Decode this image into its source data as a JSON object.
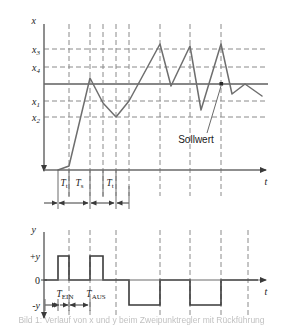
{
  "figure": {
    "caption": "Bild 1: Verlauf von x und y beim Zweipunktregler mit Rückführung"
  },
  "upper_plot": {
    "y_axis_label": "x",
    "x_axis_label": "t",
    "y_tick_labels": [
      "x3",
      "x4",
      "x1",
      "x2"
    ],
    "setpoint_annotation": "Sollwert",
    "interval_labels": [
      "Tt",
      "Ts",
      "Tt"
    ]
  },
  "lower_plot": {
    "y_axis_label": "y",
    "x_axis_label": "t",
    "y_tick_labels": [
      "+y",
      "0",
      "-y"
    ],
    "interval_labels": [
      "TEIN",
      "TAUS"
    ]
  },
  "colors": {
    "curve": "#6e6e6e",
    "setpoint": "#5f5f5f",
    "grid": "#8a8a8a",
    "axis": "#6a6a6a",
    "square_wave": "#3a3a3a",
    "text": "#1a1a1a",
    "background": "#ffffff"
  },
  "chart_data": [
    {
      "type": "line",
      "title": "Controlled variable x over time",
      "xlabel": "t",
      "ylabel": "x",
      "grid": true,
      "legend": "none",
      "ylim": [
        0,
        140
      ],
      "xlim": [
        0,
        250
      ],
      "threshold_lines": [
        {
          "name": "x3",
          "value": 112,
          "style": "dashed"
        },
        {
          "name": "x4",
          "value": 96,
          "style": "dashed"
        },
        {
          "name": "Sollwert",
          "value": 82,
          "style": "solid"
        },
        {
          "name": "x1",
          "value": 66,
          "style": "dashed"
        },
        {
          "name": "x2",
          "value": 52,
          "style": "dashed"
        }
      ],
      "vertical_gridlines": [
        60,
        84,
        98,
        112,
        126,
        155,
        183,
        212
      ],
      "series": [
        {
          "name": "x(t)",
          "x": [
            40,
            60,
            84,
            98,
            112,
            126,
            155,
            168,
            183,
            196,
            212,
            226,
            250
          ],
          "values": [
            0,
            14,
            90,
            64,
            52,
            66,
            120,
            80,
            118,
            74,
            120,
            86,
            82
          ]
        }
      ],
      "annotations": [
        {
          "text": "Sollwert",
          "x": 196,
          "y": 30,
          "points_to": {
            "x": 212,
            "y": 82
          }
        }
      ],
      "interval_marks": [
        {
          "label": "Tt",
          "from": 40,
          "to": 60
        },
        {
          "label": "Ts",
          "from": 60,
          "to": 98
        },
        {
          "label": "Tt",
          "from": 98,
          "to": 126
        }
      ]
    },
    {
      "type": "line",
      "title": "Manipulated variable y over time (two-position output)",
      "xlabel": "t",
      "ylabel": "y",
      "grid": true,
      "legend": "none",
      "ylim": [
        -1,
        1
      ],
      "xlim": [
        0,
        250
      ],
      "y_levels": {
        "+y": 1,
        "0": 0,
        "-y": -1
      },
      "series": [
        {
          "name": "y(t)",
          "steps": [
            {
              "from": 40,
              "to": 60,
              "value": 1
            },
            {
              "from": 60,
              "to": 84,
              "value": 0
            },
            {
              "from": 84,
              "to": 98,
              "value": 1
            },
            {
              "from": 98,
              "to": 126,
              "value": 0
            },
            {
              "from": 126,
              "to": 155,
              "value": -1
            },
            {
              "from": 155,
              "to": 183,
              "value": 0
            },
            {
              "from": 183,
              "to": 212,
              "value": -1
            },
            {
              "from": 212,
              "to": 250,
              "value": 0
            }
          ]
        }
      ],
      "interval_marks": [
        {
          "label": "TEIN",
          "from": 40,
          "to": 60
        },
        {
          "label": "TAUS",
          "from": 60,
          "to": 84
        }
      ]
    }
  ]
}
